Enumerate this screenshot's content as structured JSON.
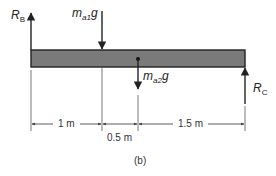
{
  "diagram": {
    "type": "free-body-diagram",
    "beam": {
      "fill": "#7a7a7a",
      "stroke": "#222222"
    },
    "forces": {
      "rb": {
        "symbol": "R",
        "subscript": "B",
        "direction": "up"
      },
      "ma1g": {
        "symbol": "m",
        "subscript": "a1",
        "suffix": "g",
        "direction": "down"
      },
      "ma2g": {
        "symbol": "m",
        "subscript": "a2",
        "suffix": "g",
        "direction": "down"
      },
      "rc": {
        "symbol": "R",
        "subscript": "C",
        "direction": "up"
      }
    },
    "dimensions": [
      {
        "label": "1 m"
      },
      {
        "label": "0.5 m"
      },
      {
        "label": "1.5 m"
      }
    ],
    "caption": "(b)"
  }
}
